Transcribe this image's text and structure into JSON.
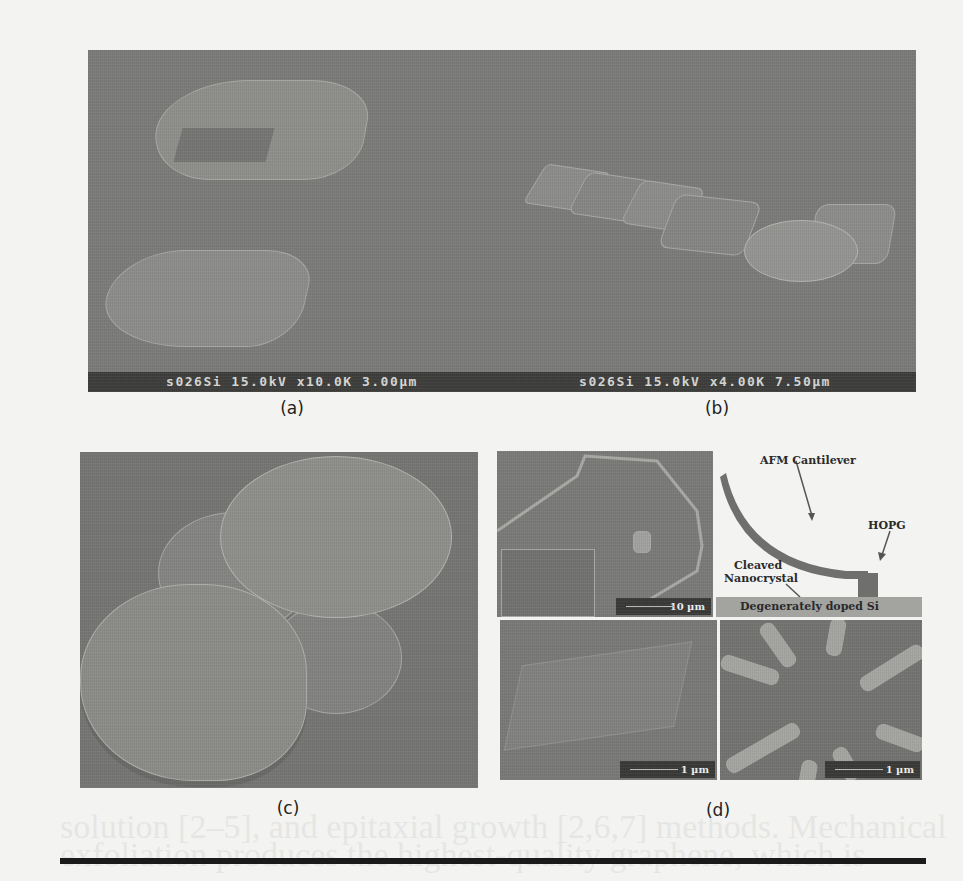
{
  "figure": {
    "panels": [
      {
        "id": "a",
        "caption": "(a)",
        "type": "SEM micrograph",
        "info_bar": "s026Si 15.0kV x10.0K 3.00µm"
      },
      {
        "id": "b",
        "caption": "(b)",
        "type": "SEM micrograph",
        "info_bar": "s026Si 15.0kV x4.00K 7.50µm"
      },
      {
        "id": "c",
        "caption": "(c)",
        "type": "SEM micrograph"
      },
      {
        "id": "d",
        "caption": "(d)",
        "subpanels": [
          {
            "position": "top-left",
            "type": "SEM micrograph with inset",
            "scale_bar": "10 µm"
          },
          {
            "position": "top-right",
            "type": "schematic",
            "labels": {
              "cantilever": "AFM Cantilever",
              "hopg": "HOPG",
              "nanocrystal_line1": "Cleaved",
              "nanocrystal_line2": "Nanocrystal",
              "oxide": "SiO",
              "oxide_sub": "2",
              "substrate": "Degenerately doped Si"
            }
          },
          {
            "position": "bottom-left",
            "type": "SEM micrograph",
            "scale_bar": "1 µm"
          },
          {
            "position": "bottom-right",
            "type": "SEM micrograph",
            "scale_bar": "1 µm"
          }
        ]
      }
    ]
  },
  "background_text": {
    "line1": "solution [2–5], and epitaxial growth [2,6,7] methods. Mechanical",
    "line2": "exfoliation produces the highest-quality graphene, which is"
  }
}
